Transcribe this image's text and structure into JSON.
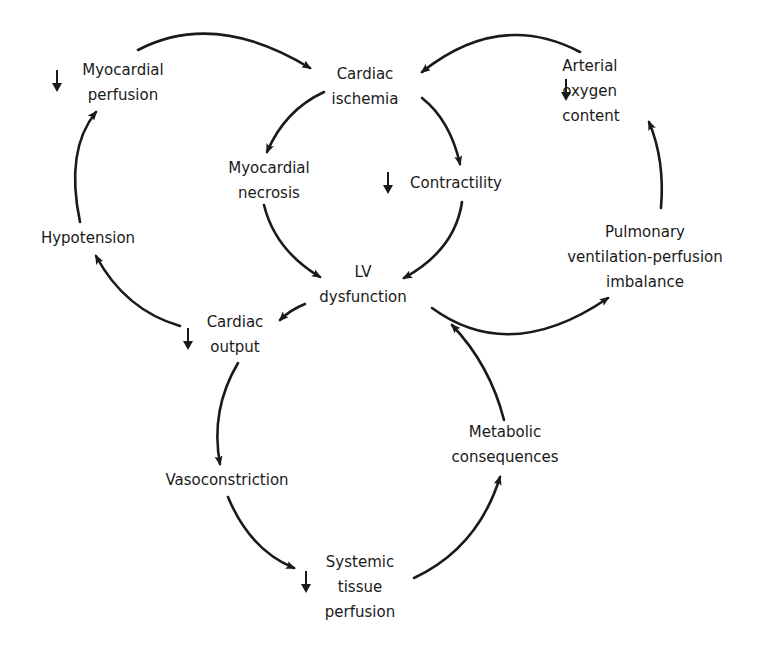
{
  "diagram": {
    "type": "causal-cycle",
    "nodes": {
      "myocardial_perfusion": {
        "lines": [
          "Myocardial",
          "perfusion"
        ],
        "decrease": true
      },
      "cardiac_ischemia": {
        "lines": [
          "Cardiac",
          "ischemia"
        ],
        "decrease": false
      },
      "arterial_oxygen_content": {
        "lines": [
          "Arterial",
          "oxygen",
          "content"
        ],
        "decrease": true
      },
      "myocardial_necrosis": {
        "lines": [
          "Myocardial",
          "necrosis"
        ],
        "decrease": false
      },
      "contractility": {
        "lines": [
          "Contractility"
        ],
        "decrease": true
      },
      "hypotension": {
        "lines": [
          "Hypotension"
        ],
        "decrease": false
      },
      "lv_dysfunction": {
        "lines": [
          "LV",
          "dysfunction"
        ],
        "decrease": false
      },
      "pulmonary_vp_imbalance": {
        "lines": [
          "Pulmonary",
          "ventilation-perfusion",
          "imbalance"
        ],
        "decrease": false
      },
      "cardiac_output": {
        "lines": [
          "Cardiac",
          "output"
        ],
        "decrease": true
      },
      "metabolic_consequences": {
        "lines": [
          "Metabolic",
          "consequences"
        ],
        "decrease": false
      },
      "vasoconstriction": {
        "lines": [
          "Vasoconstriction"
        ],
        "decrease": false
      },
      "systemic_tissue_perfusion": {
        "lines": [
          "Systemic",
          "tissue",
          "perfusion"
        ],
        "decrease": true
      }
    },
    "edges": [
      {
        "from": "myocardial_perfusion",
        "to": "cardiac_ischemia"
      },
      {
        "from": "arterial_oxygen_content",
        "to": "cardiac_ischemia"
      },
      {
        "from": "cardiac_ischemia",
        "to": "myocardial_necrosis"
      },
      {
        "from": "cardiac_ischemia",
        "to": "contractility"
      },
      {
        "from": "myocardial_necrosis",
        "to": "lv_dysfunction"
      },
      {
        "from": "contractility",
        "to": "lv_dysfunction"
      },
      {
        "from": "lv_dysfunction",
        "to": "cardiac_output"
      },
      {
        "from": "lv_dysfunction",
        "to": "pulmonary_vp_imbalance"
      },
      {
        "from": "pulmonary_vp_imbalance",
        "to": "arterial_oxygen_content"
      },
      {
        "from": "cardiac_output",
        "to": "hypotension"
      },
      {
        "from": "hypotension",
        "to": "myocardial_perfusion"
      },
      {
        "from": "cardiac_output",
        "to": "vasoconstriction"
      },
      {
        "from": "vasoconstriction",
        "to": "systemic_tissue_perfusion"
      },
      {
        "from": "systemic_tissue_perfusion",
        "to": "metabolic_consequences"
      },
      {
        "from": "metabolic_consequences",
        "to": "lv_dysfunction"
      }
    ],
    "colors": {
      "ink": "#1a1a1a",
      "background": "#ffffff"
    }
  }
}
